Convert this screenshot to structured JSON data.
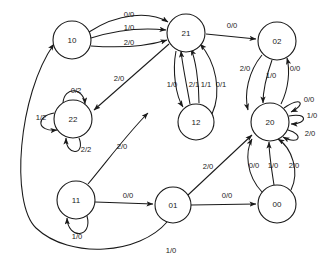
{
  "diagram": {
    "type": "finite-state-machine",
    "background_color": "#ffffff",
    "stroke_color": "#1a1a1a",
    "canvas": {
      "width": 324,
      "height": 267
    },
    "node_radius": 19,
    "nodes": [
      {
        "id": "10",
        "label": "10",
        "cx": 72,
        "cy": 40
      },
      {
        "id": "21",
        "label": "21",
        "cx": 186,
        "cy": 33
      },
      {
        "id": "02",
        "label": "02",
        "cx": 277,
        "cy": 41
      },
      {
        "id": "22",
        "label": "22",
        "cx": 73,
        "cy": 119
      },
      {
        "id": "12",
        "label": "12",
        "cx": 196,
        "cy": 122
      },
      {
        "id": "20",
        "label": "20",
        "cx": 270,
        "cy": 122
      },
      {
        "id": "11",
        "label": "11",
        "cx": 76,
        "cy": 200
      },
      {
        "id": "01",
        "label": "01",
        "cx": 173,
        "cy": 205
      },
      {
        "id": "00",
        "label": "00",
        "cx": 277,
        "cy": 204
      }
    ],
    "edges": [
      {
        "from": "10",
        "to": "21",
        "label": "0/0",
        "label_x": 129,
        "label_y": 15
      },
      {
        "from": "10",
        "to": "21",
        "label": "1/0",
        "label_x": 129,
        "label_y": 28
      },
      {
        "from": "10",
        "to": "21",
        "label": "2/0",
        "label_x": 129,
        "label_y": 43
      },
      {
        "from": "21",
        "to": "02",
        "label": "0/0",
        "label_x": 232,
        "label_y": 26
      },
      {
        "from": "21",
        "to": "22",
        "label": "2/0",
        "label_x": 119,
        "label_y": 79
      },
      {
        "from": "21",
        "to": "12",
        "label": "1/0",
        "label_x": 172,
        "label_y": 85
      },
      {
        "from": "12",
        "to": "21",
        "label": "2/1",
        "label_x": 194,
        "label_y": 85
      },
      {
        "from": "12",
        "to": "21",
        "label": "1/1",
        "label_x": 206,
        "label_y": 85
      },
      {
        "from": "12",
        "to": "21",
        "label": "0/1",
        "label_x": 221,
        "label_y": 85
      },
      {
        "from": "02",
        "to": "20",
        "label": "2/0",
        "label_x": 245,
        "label_y": 69
      },
      {
        "from": "02",
        "to": "20",
        "label": "1/0",
        "label_x": 271,
        "label_y": 76
      },
      {
        "from": "20",
        "to": "02",
        "label": "0/0",
        "label_x": 295,
        "label_y": 69
      },
      {
        "from": "20",
        "to": "20",
        "label": "0/0",
        "label_x": 309,
        "label_y": 100
      },
      {
        "from": "20",
        "to": "20",
        "label": "1/0",
        "label_x": 312,
        "label_y": 116
      },
      {
        "from": "20",
        "to": "20",
        "label": "2/0",
        "label_x": 310,
        "label_y": 134
      },
      {
        "from": "22",
        "to": "22",
        "label": "0/2",
        "label_x": 76,
        "label_y": 91
      },
      {
        "from": "22",
        "to": "22",
        "label": "1/2",
        "label_x": 41,
        "label_y": 118
      },
      {
        "from": "22",
        "to": "22",
        "label": "2/2",
        "label_x": 86,
        "label_y": 150
      },
      {
        "from": "11",
        "to": "22",
        "label": "2/0",
        "label_x": 122,
        "label_y": 147
      },
      {
        "from": "11",
        "to": "01",
        "label": "0/0",
        "label_x": 128,
        "label_y": 196
      },
      {
        "from": "11",
        "to": "11",
        "label": "1/0",
        "label_x": 77,
        "label_y": 237
      },
      {
        "from": "01",
        "to": "20",
        "label": "2/0",
        "label_x": 208,
        "label_y": 167
      },
      {
        "from": "01",
        "to": "00",
        "label": "0/0",
        "label_x": 227,
        "label_y": 196
      },
      {
        "from": "00",
        "to": "20",
        "label": "0/0",
        "label_x": 254,
        "label_y": 166
      },
      {
        "from": "00",
        "to": "20",
        "label": "1/0",
        "label_x": 273,
        "label_y": 166
      },
      {
        "from": "00",
        "to": "20",
        "label": "2/0",
        "label_x": 294,
        "label_y": 166
      },
      {
        "from": "01",
        "to": "10",
        "label": "1/0",
        "label_x": 171,
        "label_y": 251
      }
    ]
  }
}
